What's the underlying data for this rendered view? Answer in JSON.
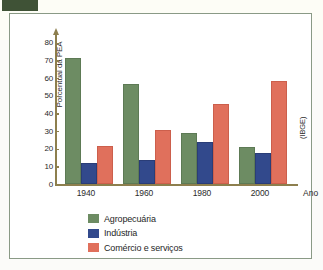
{
  "figure": {
    "source_note": "(IBGE)",
    "tab_marker": "green-tab"
  },
  "chart_data": {
    "type": "bar",
    "title": "",
    "xlabel": "Ano",
    "ylabel": "Porcentual da PEA",
    "categories": [
      "1940",
      "1960",
      "1980",
      "2000"
    ],
    "series": [
      {
        "name": "Agropecuária",
        "color": "#6d8c63",
        "values": [
          70,
          55.5,
          27.5,
          20
        ]
      },
      {
        "name": "Indústria",
        "color": "#32498c",
        "values": [
          10.5,
          12.5,
          22.5,
          16.5
        ]
      },
      {
        "name": "Comércio e serviços",
        "color": "#e0705c",
        "values": [
          20.5,
          29.5,
          44,
          57
        ]
      }
    ],
    "ylim": [
      0,
      85
    ],
    "yticks": [
      "0",
      "10",
      "20",
      "30",
      "40",
      "50",
      "60",
      "70",
      "80"
    ],
    "grid": false,
    "legend_position": "bottom-center"
  },
  "colors": {
    "green": "#6d8c63",
    "blue": "#32498c",
    "red": "#e0705c",
    "axis": "#8d7f4e",
    "panel_border": "#8a9a86",
    "tab": "#3f5236"
  }
}
